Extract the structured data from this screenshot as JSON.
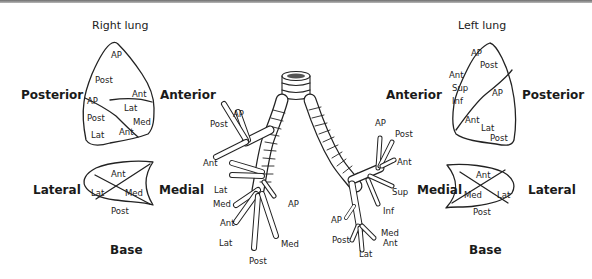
{
  "figure": {
    "right_lung": {
      "title": "Right lung",
      "lateral_view": {
        "left_orientation": "Posterior",
        "right_orientation": "Anterior",
        "segments": [
          "AP",
          "Post",
          "Ant",
          "AP",
          "Lat",
          "Post",
          "Med",
          "Lat",
          "Ant"
        ]
      },
      "base_view": {
        "left_orientation": "Lateral",
        "right_orientation": "Medial",
        "bottom_label": "Base",
        "segments": [
          "Ant",
          "Lat",
          "Med",
          "Post"
        ]
      }
    },
    "left_lung": {
      "title": "Left lung",
      "lateral_view": {
        "left_orientation": "Anterior",
        "right_orientation": "Posterior",
        "segments": [
          "AP",
          "Post",
          "Ant",
          "Sup",
          "Inf",
          "AP",
          "Ant",
          "Lat",
          "Post"
        ]
      },
      "base_view": {
        "left_orientation": "Medial",
        "right_orientation": "Lateral",
        "bottom_label": "Base",
        "segments": [
          "Ant",
          "Med",
          "Lat",
          "Post"
        ]
      }
    },
    "bronchial_tree": {
      "right_labels": [
        "AP",
        "Post",
        "Ant",
        "Lat",
        "Med",
        "AP",
        "Ant",
        "Lat",
        "Post",
        "Med"
      ],
      "left_labels": [
        "AP",
        "Post",
        "Ant",
        "Sup",
        "Inf",
        "AP",
        "Post",
        "Lat",
        "Med",
        "Ant"
      ]
    }
  }
}
